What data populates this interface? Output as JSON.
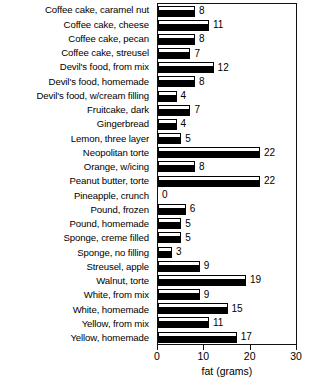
{
  "chart_data": {
    "type": "bar",
    "orientation": "horizontal",
    "title": "",
    "xlabel": "fat (grams)",
    "ylabel": "",
    "xlim": [
      0,
      30
    ],
    "xticks": [
      0,
      10,
      20,
      30
    ],
    "grid": false,
    "legend": null,
    "bar_style": "white-top-black-bottom-3d",
    "value_labels": true,
    "categories": [
      "Coffee cake, caramel nut",
      "Coffee cake, cheese",
      "Coffee cake, pecan",
      "Coffee cake, streusel",
      "Devil's food, from mix",
      "Devil's food, homemade",
      "Devil's food, w/cream filling",
      "Fruitcake, dark",
      "Gingerbread",
      "Lemon, three layer",
      "Neopolitan torte",
      "Orange, w/icing",
      "Peanut butter, torte",
      "Pineapple, crunch",
      "Pound, frozen",
      "Pound, homemade",
      "Sponge, creme filled",
      "Sponge, no filling",
      "Streusel, apple",
      "Walnut, torte",
      "White, from mix",
      "White, homemade",
      "Yellow, from mix",
      "Yellow, homemade"
    ],
    "values": [
      8,
      11,
      8,
      7,
      12,
      8,
      4,
      7,
      4,
      5,
      22,
      8,
      22,
      0,
      6,
      5,
      5,
      3,
      9,
      19,
      9,
      15,
      11,
      17
    ]
  },
  "axis": {
    "x_tick_labels": [
      "0",
      "10",
      "20",
      "30"
    ],
    "x_title": "fat (grams)"
  }
}
